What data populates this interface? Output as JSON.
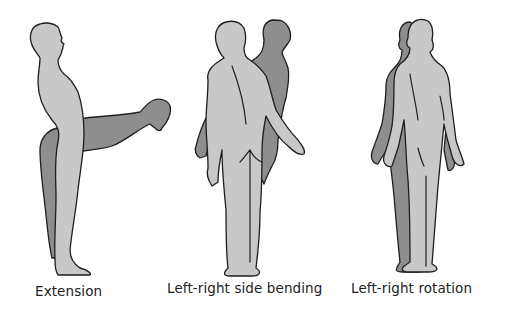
{
  "diagram": {
    "title": "",
    "colors": {
      "body_primary": "#c8c8c8",
      "body_secondary": "#8e8e8e",
      "outline": "#1e1e1e",
      "background": "#ffffff"
    },
    "panels": [
      {
        "caption": "Extension",
        "figures": [
          "standing side-view figure (light)",
          "forward-bent figure (dark)"
        ]
      },
      {
        "caption": "Left-right side bending",
        "figures": [
          "back-view figure bending (light)",
          "offset figure (dark)"
        ]
      },
      {
        "caption": "Left-right rotation",
        "figures": [
          "back-view figure (light)",
          "rotated figure (dark)"
        ]
      }
    ]
  }
}
